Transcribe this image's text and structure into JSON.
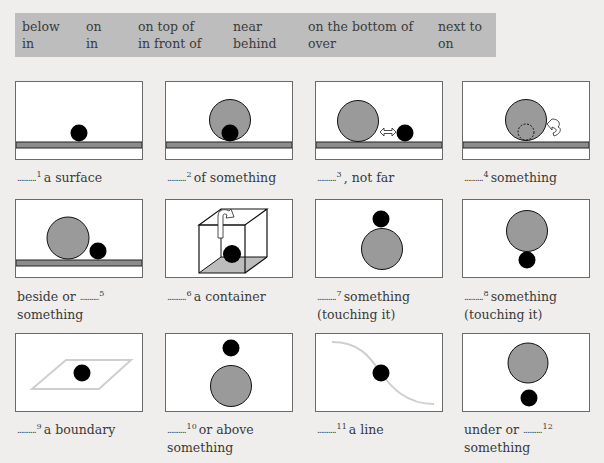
{
  "word_bank": {
    "columns": [
      [
        "below",
        "in"
      ],
      [
        "on",
        "in"
      ],
      [
        "on top of",
        "in front of"
      ],
      [
        "near",
        "behind"
      ],
      [
        "on the bottom of",
        "over"
      ],
      [
        "next to",
        "on"
      ]
    ]
  },
  "items": [
    {
      "number": "1",
      "before": "",
      "after": "a surface",
      "line2": "",
      "illustration": "ball-on-surface"
    },
    {
      "number": "2",
      "before": "",
      "after": "of something",
      "line2": "",
      "illustration": "ball-in-front-of-circle"
    },
    {
      "number": "3",
      "before": "",
      "after": ", not far",
      "line2": "",
      "illustration": "ball-near-circle"
    },
    {
      "number": "4",
      "before": "",
      "after": "something",
      "line2": "",
      "illustration": "ball-behind-circle"
    },
    {
      "number": "5",
      "before": "beside or",
      "after": "",
      "line2": "something",
      "illustration": "ball-next-to-circle"
    },
    {
      "number": "6",
      "before": "",
      "after": "a container",
      "line2": "",
      "illustration": "ball-in-box"
    },
    {
      "number": "7",
      "before": "",
      "after": "something",
      "line2": "(touching it)",
      "illustration": "ball-on-top-of-circle"
    },
    {
      "number": "8",
      "before": "",
      "after": "something",
      "line2": "(touching it)",
      "illustration": "ball-on-bottom-of-circle"
    },
    {
      "number": "9",
      "before": "",
      "after": "a boundary",
      "line2": "",
      "illustration": "ball-in-area"
    },
    {
      "number": "10",
      "before": "",
      "after": "or above",
      "line2": "something",
      "illustration": "ball-over-circle"
    },
    {
      "number": "11",
      "before": "",
      "after": "a line",
      "line2": "",
      "illustration": "ball-on-line"
    },
    {
      "number": "12",
      "before": "under or",
      "after": "",
      "line2": "something",
      "illustration": "ball-below-circle"
    }
  ],
  "blank": "..........",
  "colors": {
    "word_bank_bg": "#bdbdbd",
    "large_circle": "#9a9a9a",
    "small_ball": "#000000",
    "surface": "#8c8c8c",
    "boundary": "#cfcfcf",
    "page_bg": "#efeeec"
  }
}
